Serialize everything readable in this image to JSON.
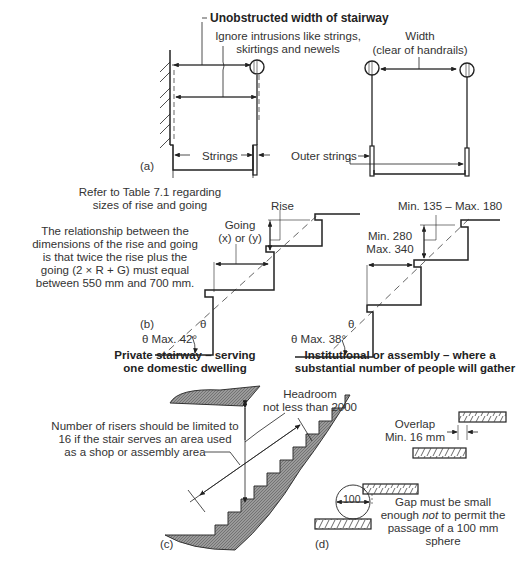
{
  "panel_a": {
    "tag": "(a)",
    "title": "Unobstructed width of stairway",
    "note_line1": "Ignore intrusions like strings,",
    "note_line2": "skirtings and newels",
    "width_line1": "Width",
    "width_line2": "(clear of handrails)",
    "strings": "Strings",
    "outer_strings": "Outer strings"
  },
  "panel_b": {
    "tag": "(b)",
    "refer_line1": "Refer to Table 7.1 regarding",
    "refer_line2": "sizes of rise and going",
    "relation": [
      "The relationship between the",
      "dimensions of the rise and going",
      "is that twice the rise plus the",
      "going (2 × R + G) must equal",
      "between 550 mm and 700 mm."
    ],
    "going_line1": "Going",
    "going_line2": "(x) or (y)",
    "rise": "Rise",
    "theta": "θ",
    "private_max": "θ Max. 42°",
    "private_caption_line1": "Private stairway – serving",
    "private_caption_line2": "one domestic dwelling",
    "inst_rise": "Min. 135 – Max. 180",
    "inst_going_line1": "Min. 280",
    "inst_going_line2": "Max. 340",
    "inst_max": "θ Max. 38°",
    "inst_caption_line1": "Institutional or assembly – where a",
    "inst_caption_line2": "substantial number of people will gather"
  },
  "panel_c": {
    "tag": "(c)",
    "headroom_line1": "Headroom",
    "headroom_line2": "not less than 2000",
    "risers_line1": "Number of risers should be limited to",
    "risers_line2": "16 if the stair serves an area used",
    "risers_line3": "as a shop or assembly area"
  },
  "panel_d": {
    "tag": "(d)",
    "overlap_line1": "Overlap",
    "overlap_line2": "Min. 16 mm",
    "sphere": "100",
    "gap_line1": "Gap must be small",
    "gap_line2_pre": "enough ",
    "gap_line2_em": "not",
    "gap_line2_post": " to permit the",
    "gap_line3": "passage of a 100 mm",
    "gap_line4": "sphere"
  }
}
